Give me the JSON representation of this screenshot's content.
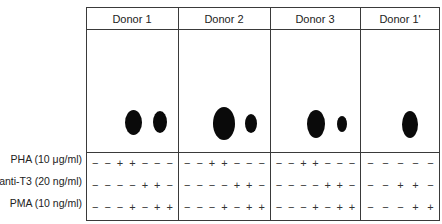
{
  "figure": {
    "columns": [
      {
        "label": "Donor 1",
        "left": 86,
        "width": 92
      },
      {
        "label": "Donor 2",
        "left": 178,
        "width": 92
      },
      {
        "label": "Donor 3",
        "left": 270,
        "width": 90
      },
      {
        "label": "Donor 1'",
        "left": 360,
        "width": 80
      }
    ],
    "treatments": [
      {
        "label": "PHA (10 μg/ml)",
        "y": 159
      },
      {
        "label": "anti-T3 (20 ng/ml)",
        "y": 180
      },
      {
        "label": "PMA (10 ng/ml)",
        "y": 202
      }
    ],
    "conditions": {
      "donor_1": {
        "pha": [
          "−",
          "−",
          "+",
          "+",
          "−",
          "−",
          "−"
        ],
        "anti_t3": [
          "−",
          "−",
          "−",
          "−",
          "+",
          "+",
          "−"
        ],
        "pma": [
          "−",
          "−",
          "−",
          "+",
          "−",
          "+",
          "+"
        ]
      },
      "donor_2": {
        "pha": [
          "−",
          "−",
          "+",
          "+",
          "−",
          "−",
          "−"
        ],
        "anti_t3": [
          "−",
          "−",
          "−",
          "−",
          "+",
          "+",
          "−"
        ],
        "pma": [
          "−",
          "−",
          "−",
          "+",
          "−",
          "+",
          "+"
        ]
      },
      "donor_3": {
        "pha": [
          "−",
          "−",
          "+",
          "+",
          "−",
          "−",
          "−"
        ],
        "anti_t3": [
          "−",
          "−",
          "−",
          "−",
          "+",
          "+",
          "−"
        ],
        "pma": [
          "−",
          "−",
          "−",
          "+",
          "−",
          "+",
          "+"
        ]
      },
      "donor_1_prime": {
        "pha": [
          "−",
          "−",
          "−",
          "−",
          "−"
        ],
        "anti_t3": [
          "−",
          "−",
          "+",
          "+",
          "−"
        ],
        "pma": [
          "−",
          "−",
          "−",
          "+",
          "+"
        ]
      }
    },
    "spots": [
      {
        "donor": "Donor 1",
        "cx": 133,
        "cy": 122,
        "w": 17,
        "h": 25
      },
      {
        "donor": "Donor 1",
        "cx": 160,
        "cy": 122,
        "w": 14,
        "h": 22
      },
      {
        "donor": "Donor 2",
        "cx": 224,
        "cy": 123,
        "w": 22,
        "h": 33
      },
      {
        "donor": "Donor 2",
        "cx": 251,
        "cy": 123,
        "w": 12,
        "h": 19
      },
      {
        "donor": "Donor 3",
        "cx": 316,
        "cy": 124,
        "w": 18,
        "h": 28
      },
      {
        "donor": "Donor 3",
        "cx": 342,
        "cy": 124,
        "w": 10,
        "h": 16
      },
      {
        "donor": "Donor 1'",
        "cx": 410,
        "cy": 124,
        "w": 16,
        "h": 27
      }
    ],
    "colors": {
      "border": "#3a3a3a",
      "spot": "#0a0a0a",
      "text": "#222222"
    }
  }
}
